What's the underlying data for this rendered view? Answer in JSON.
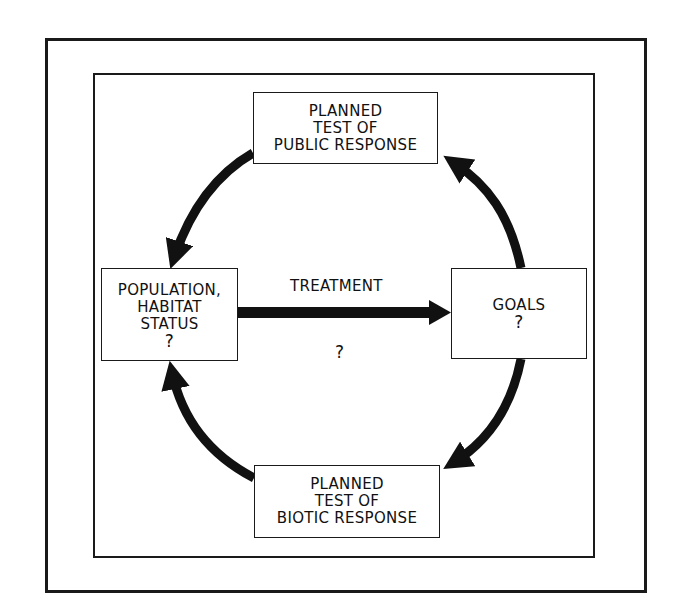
{
  "diagram": {
    "boxes": {
      "public_response": {
        "lines": [
          "PLANNED",
          "TEST OF",
          "PUBLIC RESPONSE"
        ]
      },
      "population": {
        "lines": [
          "POPULATION,",
          "HABITAT",
          "STATUS",
          "?"
        ]
      },
      "goals": {
        "lines": [
          "GOALS",
          "?"
        ]
      },
      "biotic_response": {
        "lines": [
          "PLANNED",
          "TEST OF",
          "BIOTIC RESPONSE"
        ]
      }
    },
    "treatment_arrow": {
      "label": "TREATMENT",
      "sublabel": "?"
    },
    "cycle_arrows": [
      {
        "from": "goals",
        "to": "public_response"
      },
      {
        "from": "public_response",
        "to": "population"
      },
      {
        "from": "biotic_response",
        "to": "population"
      },
      {
        "from": "goals",
        "to": "biotic_response"
      }
    ],
    "colors": {
      "ink": "#1a1a1a",
      "background": "#ffffff"
    }
  }
}
